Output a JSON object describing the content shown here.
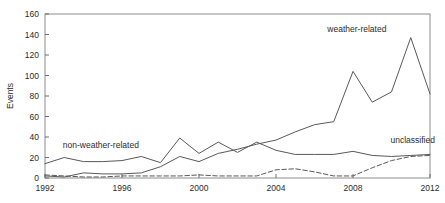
{
  "chart_data": {
    "type": "line",
    "title": "",
    "xlabel": "",
    "ylabel": "Events",
    "xlim": [
      1992,
      2012
    ],
    "ylim": [
      0,
      160
    ],
    "grid": false,
    "legend_position": "inline-annotations",
    "xticks": [
      "1992",
      "1996",
      "2000",
      "2004",
      "2008",
      "2012"
    ],
    "xtick_values": [
      1992,
      1996,
      2000,
      2004,
      2008,
      2012
    ],
    "yticks": [
      "0",
      "20",
      "40",
      "60",
      "80",
      "100",
      "120",
      "140",
      "160"
    ],
    "ytick_values": [
      0,
      20,
      40,
      60,
      80,
      100,
      120,
      140,
      160
    ],
    "x": [
      1992,
      1993,
      1994,
      1995,
      1996,
      1997,
      1998,
      1999,
      2000,
      2001,
      2002,
      2003,
      2004,
      2005,
      2006,
      2007,
      2008,
      2009,
      2010,
      2011,
      2012
    ],
    "series": [
      {
        "name": "weather-related",
        "style": "solid",
        "color": "#595959",
        "label": "weather-related",
        "values": [
          2,
          1,
          5,
          4,
          4,
          5,
          11,
          21,
          16,
          24,
          28,
          33,
          37,
          45,
          52,
          55,
          104,
          74,
          84,
          137,
          82
        ]
      },
      {
        "name": "non-weather-related",
        "style": "solid",
        "color": "#595959",
        "label": "non-weather-related",
        "values": [
          14,
          20,
          16,
          16,
          17,
          21,
          15,
          39,
          24,
          35,
          25,
          35,
          27,
          23,
          23,
          23,
          26,
          22,
          21,
          22,
          23
        ]
      },
      {
        "name": "unclassified",
        "style": "dashed",
        "color": "#595959",
        "label": "unclassified",
        "values": [
          3,
          2,
          1,
          1,
          2,
          2,
          2,
          2,
          3,
          2,
          2,
          2,
          8,
          9,
          6,
          2,
          2,
          10,
          17,
          21,
          22
        ]
      }
    ],
    "annotations": [
      {
        "text": "weather-related",
        "x": 2008.2,
        "y": 142,
        "anchor": "middle"
      },
      {
        "text": "non-weather-related",
        "x": 1994.9,
        "y": 29,
        "anchor": "middle"
      },
      {
        "text": "unclassified",
        "x": 2011.1,
        "y": 34,
        "anchor": "middle"
      }
    ]
  }
}
